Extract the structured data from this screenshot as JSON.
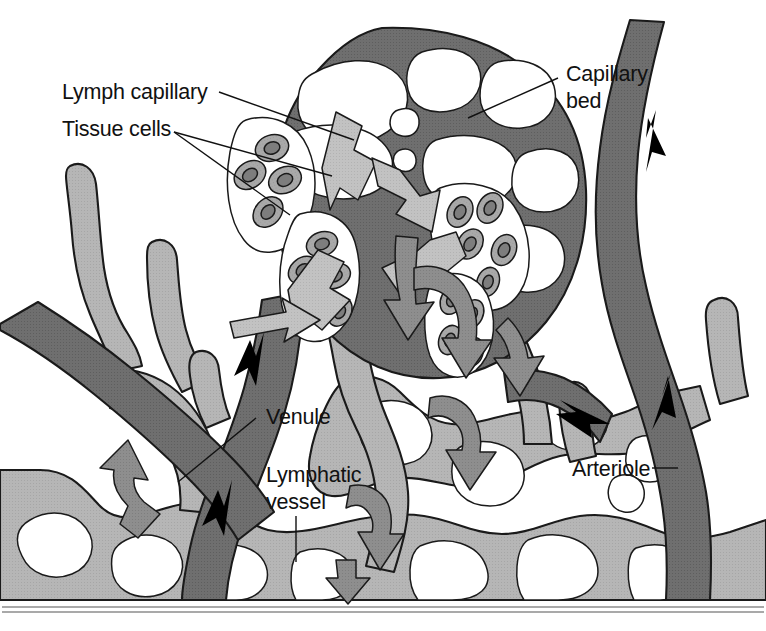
{
  "figure": {
    "domain": "anatomy-diagram",
    "width": 766,
    "height": 631,
    "background": "#ffffff"
  },
  "palette": {
    "blood_vessel_dark": "#6f6f6f",
    "lymphatic_light": "#b6b6b6",
    "tissue_cell_body": "#a9a9a9",
    "tissue_cell_nucleus": "#7d7d7d",
    "flow_arrow_light": "#c2c2c2",
    "flow_arrow_mid": "#8e8e8e",
    "lumen_white": "#ffffff",
    "outline": "#1a1a1a",
    "label_text": "#111111",
    "rule_gray": "#8d8d8d"
  },
  "labels": [
    {
      "id": "lymph-capillary",
      "text": "Lymph capillary",
      "x": 62,
      "y": 99,
      "lines": [
        "Lymph capillary"
      ],
      "leader_from": [
        217,
        92
      ],
      "leader_to": [
        352,
        140
      ]
    },
    {
      "id": "tissue-cells",
      "text": "Tissue cells",
      "x": 62,
      "y": 136,
      "lines": [
        "Tissue cells"
      ],
      "leader_from": [
        172,
        132
      ],
      "leader_to": [
        330,
        175
      ]
    },
    {
      "id": "capillary-bed",
      "text": "Capillary bed",
      "x": 566,
      "y": 81,
      "lines": [
        "Capillary",
        "bed"
      ],
      "leader_from": [
        556,
        78
      ],
      "leader_to": [
        470,
        118
      ]
    },
    {
      "id": "venule",
      "text": "Venule",
      "x": 265,
      "y": 422,
      "lines": [
        "Venule"
      ],
      "leader_from": [
        258,
        418
      ],
      "leader_to": [
        180,
        480
      ]
    },
    {
      "id": "lymphatic-vessel",
      "text": "Lymphatic vessel",
      "x": 265,
      "y": 480,
      "lines": [
        "Lymphatic",
        "vessel"
      ],
      "leader_from": [
        296,
        515
      ],
      "leader_to": [
        296,
        562
      ]
    },
    {
      "id": "arteriole",
      "text": "Arteriole",
      "x": 572,
      "y": 475,
      "lines": [
        "Arteriole"
      ],
      "leader_from": [
        652,
        468
      ],
      "leader_to": [
        676,
        468
      ]
    }
  ],
  "flow_arrows": [
    {
      "id": "blood-flow-venule-upper",
      "kind": "black-line-arrow",
      "direction": "down-left",
      "vessel": "venule"
    },
    {
      "id": "blood-flow-venule-lower",
      "kind": "black-line-arrow",
      "direction": "down-left",
      "vessel": "venule"
    },
    {
      "id": "blood-flow-arteriole-up",
      "kind": "black-line-arrow",
      "direction": "up",
      "vessel": "arteriole"
    },
    {
      "id": "blood-flow-arteriole-branch",
      "kind": "black-line-arrow",
      "direction": "up-left",
      "vessel": "arteriole"
    },
    {
      "id": "fluid-into-lymph-capillary-left",
      "kind": "block-arrow",
      "direction": "down-left",
      "tone": "light"
    },
    {
      "id": "fluid-into-lymph-capillary-center",
      "kind": "block-arrow",
      "direction": "down",
      "tone": "light"
    },
    {
      "id": "fluid-into-lymph-capillary-right",
      "kind": "block-arrow",
      "direction": "down-left",
      "tone": "light"
    },
    {
      "id": "lymph-flow-upper-center",
      "kind": "block-arrow",
      "direction": "down",
      "tone": "mid"
    },
    {
      "id": "lymph-flow-mid-right",
      "kind": "block-arrow",
      "direction": "down",
      "tone": "mid"
    },
    {
      "id": "lymph-flow-lower-right",
      "kind": "block-arrow",
      "direction": "down",
      "tone": "mid"
    },
    {
      "id": "lymph-flow-lower-center",
      "kind": "block-arrow",
      "direction": "down",
      "tone": "mid"
    },
    {
      "id": "lymph-flow-bottom-left",
      "kind": "block-arrow",
      "direction": "left",
      "tone": "mid"
    }
  ],
  "structures": {
    "capillary_bed": {
      "name": "capillary-bed-mesh",
      "tone": "blood_vessel_dark"
    },
    "venule": {
      "name": "venule-vessel",
      "tone": "blood_vessel_dark"
    },
    "arteriole": {
      "name": "arteriole-vessel",
      "tone": "blood_vessel_dark"
    },
    "lymphatic_network": {
      "name": "lymphatic-vessel-network",
      "tone": "lymphatic_light"
    },
    "lymph_capillaries": {
      "name": "lymph-capillary-blind-ends",
      "tone": "lymphatic_light"
    },
    "tissue_cell_clusters": [
      {
        "id": "cluster-upper-left",
        "cell_count": 4
      },
      {
        "id": "cluster-mid-left",
        "cell_count": 5
      },
      {
        "id": "cluster-upper-right",
        "cell_count": 5
      },
      {
        "id": "cluster-lower-right",
        "cell_count": 4
      }
    ]
  },
  "footer": {
    "rule": true
  }
}
